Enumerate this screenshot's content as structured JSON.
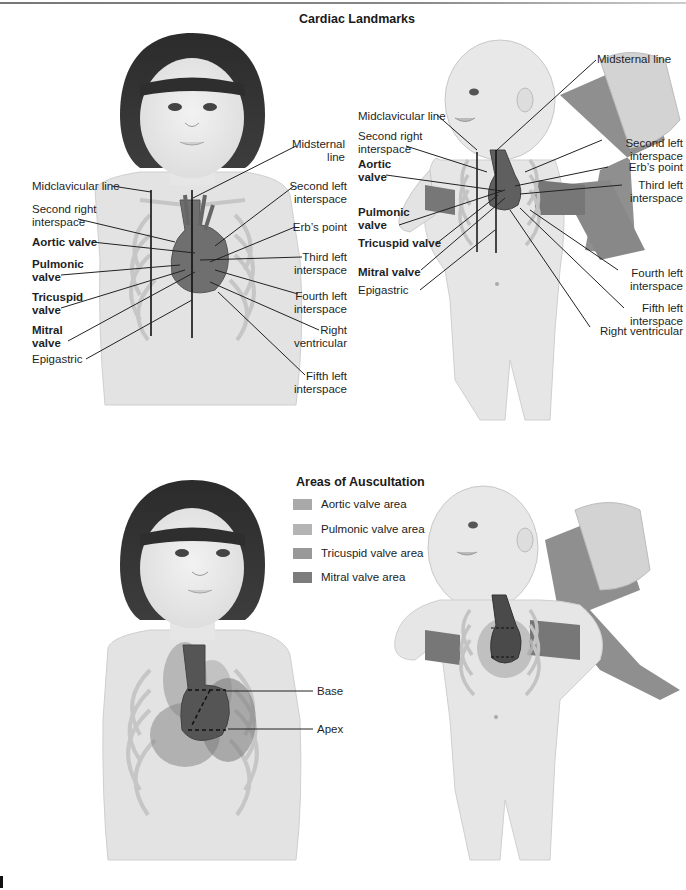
{
  "figure": {
    "top_panel": {
      "title": "Cardiac Landmarks",
      "child_labels": {
        "midclavicular_line": "Midclavicular line",
        "second_right_interspace": [
          "Second right",
          "interspace"
        ],
        "aortic_valve": "Aortic valve",
        "pulmonic_valve": [
          "Pulmonic",
          "valve"
        ],
        "tricuspid_valve": [
          "Tricuspid",
          "valve"
        ],
        "mitral_valve": [
          "Mitral",
          "valve"
        ],
        "epigastric": "Epigastric",
        "midsternal_line": [
          "Midsternal",
          "line"
        ],
        "second_left_interspace": [
          "Second left",
          "interspace"
        ],
        "erbs_point": "Erb’s point",
        "third_left_interspace": [
          "Third left",
          "interspace"
        ],
        "fourth_left_interspace": [
          "Fourth left",
          "interspace"
        ],
        "right_ventricular": [
          "Right",
          "ventricular"
        ],
        "fifth_left_interspace": [
          "Fifth left",
          "interspace"
        ]
      },
      "infant_labels": {
        "midsternal_line": "Midsternal line",
        "midclavicular_line": "Midclavicular line",
        "second_right_interspace": [
          "Second right",
          "interspace"
        ],
        "aortic_valve": [
          "Aortic",
          "valve"
        ],
        "pulmonic_valve": [
          "Pulmonic",
          "valve"
        ],
        "tricuspid_valve": "Tricuspid valve",
        "mitral_valve": "Mitral valve",
        "epigastric": "Epigastric",
        "second_left_interspace": [
          "Second left",
          "interspace"
        ],
        "erbs_point": "Erb’s point",
        "third_left_interspace": [
          "Third left",
          "interspace"
        ],
        "fourth_left_interspace": [
          "Fourth left",
          "interspace"
        ],
        "fifth_left_interspace": [
          "Fifth left",
          "interspace"
        ],
        "right_ventricular": "Right ventricular"
      }
    },
    "bottom_panel": {
      "title": "Areas of Auscultation",
      "legend": [
        {
          "label": "Aortic valve area",
          "color": "#a9a9a9"
        },
        {
          "label": "Pulmonic valve area",
          "color": "#b4b4b4"
        },
        {
          "label": "Tricuspid valve area",
          "color": "#999999"
        },
        {
          "label": "Mitral valve area",
          "color": "#7c7c7c"
        }
      ],
      "child_labels": {
        "base": "Base",
        "apex": "Apex"
      }
    }
  }
}
